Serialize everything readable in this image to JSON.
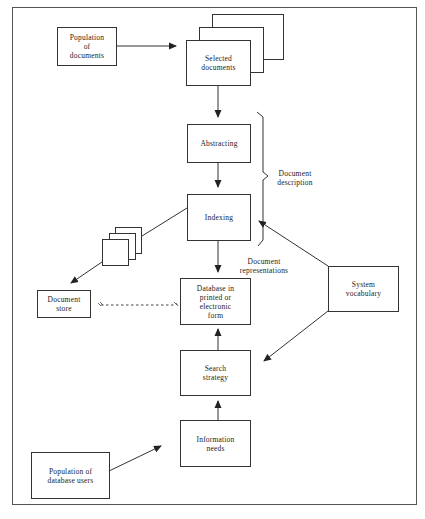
{
  "diagram": {
    "type": "flowchart",
    "title": "",
    "nodes": {
      "population_documents": "Population\nof\ndocuments",
      "selected_documents": "Selected\ndocuments",
      "abstracting": "Abstracting",
      "indexing": "Indexing",
      "database": "Database in\nprinted or\nelectronic\nform",
      "document_store": "Document\nstore",
      "system_vocabulary": "System\nvocabulary",
      "search_strategy": "Search\nstrategy",
      "information_needs": "Information\nneeds",
      "population_users": "Population of\ndatabase users"
    },
    "annotations": {
      "document_description": "Document\ndescription",
      "document_representations": "Document\nrepresentations"
    },
    "edges": [
      {
        "from": "Population of documents",
        "to": "Selected documents",
        "style": "solid"
      },
      {
        "from": "Selected documents",
        "to": "Abstracting",
        "style": "solid"
      },
      {
        "from": "Abstracting",
        "to": "Indexing",
        "style": "solid"
      },
      {
        "from": "Indexing",
        "to": "Database in printed or electronic form",
        "style": "solid"
      },
      {
        "from": "Indexing",
        "to": "Document store",
        "style": "solid",
        "via": "document copies"
      },
      {
        "from": "Document store",
        "to": "Database in printed or electronic form",
        "style": "dashed"
      },
      {
        "from": "System vocabulary",
        "to": "Indexing",
        "style": "solid"
      },
      {
        "from": "System vocabulary",
        "to": "Search strategy",
        "style": "solid"
      },
      {
        "from": "Search strategy",
        "to": "Database in printed or electronic form",
        "style": "solid"
      },
      {
        "from": "Information needs",
        "to": "Search strategy",
        "style": "solid"
      },
      {
        "from": "Population of database users",
        "to": "Information needs",
        "style": "solid"
      }
    ],
    "colors": {
      "stroke": "#333333",
      "background": "#ffffff",
      "frame": "#555555"
    }
  }
}
